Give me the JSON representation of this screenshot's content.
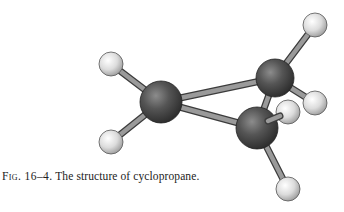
{
  "figure": {
    "label": "Fig. 16–4.",
    "caption": "The structure of cyclopropane.",
    "atoms": [
      {
        "id": "C1",
        "element": "carbon",
        "x": 161,
        "y": 102,
        "r": 21
      },
      {
        "id": "C2",
        "element": "carbon",
        "x": 275,
        "y": 78,
        "r": 19
      },
      {
        "id": "C3",
        "element": "carbon",
        "x": 257,
        "y": 128,
        "r": 21
      },
      {
        "id": "H1",
        "element": "hydrogen",
        "x": 111,
        "y": 64,
        "r": 12
      },
      {
        "id": "H2",
        "element": "hydrogen",
        "x": 111,
        "y": 142,
        "r": 12
      },
      {
        "id": "H3",
        "element": "hydrogen",
        "x": 315,
        "y": 25,
        "r": 12
      },
      {
        "id": "H4",
        "element": "hydrogen",
        "x": 315,
        "y": 103,
        "r": 12
      },
      {
        "id": "H5",
        "element": "hydrogen",
        "x": 288,
        "y": 112,
        "r": 12
      },
      {
        "id": "H6",
        "element": "hydrogen",
        "x": 288,
        "y": 189,
        "r": 12
      }
    ],
    "colors": {
      "carbon": "#4a4a4a",
      "hydrogen": "#d8d8d8",
      "bond": "#8a8a8a",
      "text": "#222222",
      "background": "#ffffff"
    }
  }
}
